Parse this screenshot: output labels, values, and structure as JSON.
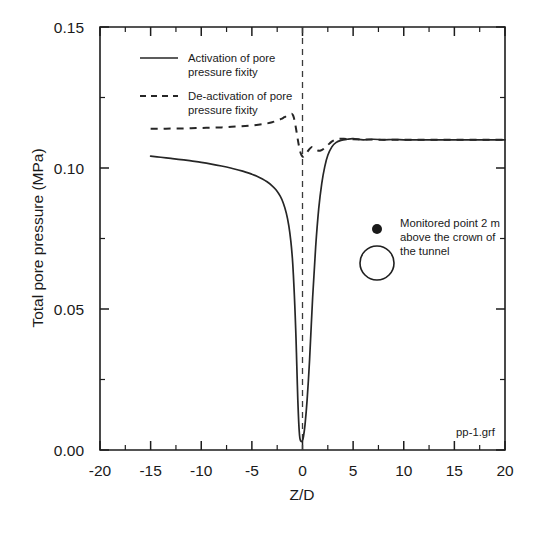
{
  "figure": {
    "corner_label": "pp-1.grf"
  },
  "chart_data": {
    "type": "line",
    "title": "",
    "xlabel": "Z/D",
    "ylabel": "Total pore pressure (MPa)",
    "xlim": [
      -20,
      20
    ],
    "ylim": [
      0.0,
      0.15
    ],
    "grid": false,
    "legend_position": "upper-left-inside",
    "x_ticks": [
      -20,
      -15,
      -10,
      -5,
      0,
      5,
      10,
      15,
      20
    ],
    "x_tick_labels": [
      "-20",
      "-15",
      "-10",
      "-5",
      "0",
      "5",
      "10",
      "15",
      "20"
    ],
    "x_minor_ticks": [
      -17.5,
      -12.5,
      -7.5,
      -2.5,
      2.5,
      7.5,
      12.5,
      17.5
    ],
    "y_ticks": [
      0.0,
      0.05,
      0.1,
      0.15
    ],
    "y_tick_labels": [
      "0.00",
      "0.05",
      "0.10",
      "0.15"
    ],
    "y_minor_ticks": [
      0.025,
      0.075,
      0.125
    ],
    "reference_lines": [
      {
        "name": "tunnel-face-position",
        "orientation": "vertical",
        "x": 0,
        "style": "dashed"
      }
    ],
    "series": [
      {
        "name": "Activation of pore pressure fixity",
        "style": "solid",
        "x": [
          -15.0,
          -14.0,
          -13.0,
          -12.0,
          -11.0,
          -10.0,
          -9.0,
          -8.0,
          -7.0,
          -6.0,
          -5.0,
          -4.5,
          -4.0,
          -3.5,
          -3.0,
          -2.6,
          -2.2,
          -1.9,
          -1.6,
          -1.35,
          -1.15,
          -1.0,
          -0.9,
          -0.8,
          -0.72,
          -0.64,
          -0.58,
          -0.52,
          -0.46,
          -0.4,
          -0.33,
          -0.26,
          -0.18,
          -0.1,
          0.0,
          0.1,
          0.25,
          0.45,
          0.7,
          1.0,
          1.3,
          1.6,
          1.9,
          2.2,
          2.5,
          2.9,
          3.3,
          3.8,
          4.4,
          5.0,
          6.0,
          7.0,
          8.0,
          9.0,
          10.0,
          11.0,
          12.0,
          13.0,
          14.0,
          15.0,
          16.0,
          17.0,
          18.0,
          19.0,
          20.0
        ],
        "y": [
          0.1042,
          0.1038,
          0.1034,
          0.103,
          0.1025,
          0.102,
          0.1014,
          0.1007,
          0.0999,
          0.099,
          0.0978,
          0.0971,
          0.0962,
          0.0951,
          0.0937,
          0.0922,
          0.09,
          0.0876,
          0.084,
          0.0795,
          0.074,
          0.068,
          0.062,
          0.0545,
          0.0475,
          0.0395,
          0.032,
          0.0245,
          0.0175,
          0.012,
          0.007,
          0.0042,
          0.0032,
          0.003,
          0.0033,
          0.0048,
          0.009,
          0.0175,
          0.032,
          0.054,
          0.072,
          0.0855,
          0.0945,
          0.1005,
          0.1045,
          0.1075,
          0.109,
          0.1098,
          0.1102,
          0.1104,
          0.11,
          0.1102,
          0.11,
          0.1101,
          0.11,
          0.11,
          0.11,
          0.11,
          0.11,
          0.11,
          0.11,
          0.11,
          0.11,
          0.11,
          0.11
        ]
      },
      {
        "name": "De-activation of pore pressure fixity",
        "style": "dashed",
        "x": [
          -15.0,
          -14.0,
          -13.0,
          -12.0,
          -11.0,
          -10.0,
          -9.0,
          -8.0,
          -7.0,
          -6.0,
          -5.0,
          -4.0,
          -3.5,
          -3.0,
          -2.5,
          -2.1,
          -1.8,
          -1.5,
          -1.25,
          -1.05,
          -0.95,
          -0.85,
          -0.75,
          -0.65,
          -0.55,
          -0.45,
          -0.35,
          -0.25,
          -0.15,
          -0.05,
          0.05,
          0.15,
          0.3,
          0.5,
          0.7,
          0.9,
          1.1,
          1.3,
          1.5,
          1.8,
          2.1,
          2.4,
          2.7,
          3.0,
          3.4,
          3.8,
          4.3,
          5.0,
          6.0,
          7.0,
          8.0,
          9.0,
          10.0,
          11.0,
          12.0,
          13.0,
          14.0,
          15.0,
          16.0,
          17.0,
          18.0,
          19.0,
          20.0
        ],
        "y": [
          0.1139,
          0.1139,
          0.114,
          0.114,
          0.1141,
          0.1142,
          0.1143,
          0.1144,
          0.1146,
          0.1148,
          0.1151,
          0.1155,
          0.1158,
          0.1162,
          0.1168,
          0.1174,
          0.118,
          0.1186,
          0.119,
          0.1192,
          0.1188,
          0.1178,
          0.1162,
          0.1142,
          0.112,
          0.1098,
          0.1078,
          0.1062,
          0.105,
          0.1043,
          0.104,
          0.1042,
          0.1048,
          0.1058,
          0.1068,
          0.1074,
          0.1072,
          0.1066,
          0.1062,
          0.1062,
          0.1068,
          0.1078,
          0.1088,
          0.1096,
          0.1102,
          0.1104,
          0.1103,
          0.1102,
          0.1101,
          0.1101,
          0.11,
          0.11,
          0.11,
          0.11,
          0.11,
          0.11,
          0.11,
          0.11,
          0.11,
          0.11,
          0.11,
          0.11,
          0.11
        ]
      }
    ],
    "legend": [
      {
        "label_line1": "Activation of pore",
        "label_line2": "pressure fixity",
        "style": "solid"
      },
      {
        "label_line1": "De-activation of pore",
        "label_line2": "pressure fixity",
        "style": "dashed"
      }
    ],
    "annotations": [
      {
        "name": "monitored-point-note",
        "line1": "Monitored point 2 m",
        "line2": "above the crown of",
        "line3": "the tunnel",
        "markers": [
          "filled-dot",
          "open-circle"
        ]
      }
    ]
  }
}
